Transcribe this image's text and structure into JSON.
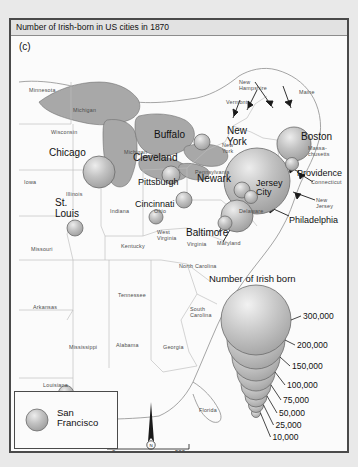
{
  "figure": {
    "title": "Number of Irish-born in US cities in 1870",
    "panel_label": "(c)"
  },
  "legend": {
    "title": "Number of Irish born",
    "values": [
      "300,000",
      "200,000",
      "150,000",
      "100,000",
      "75,000",
      "50,000",
      "25,000",
      "10,000"
    ]
  },
  "inset": {
    "city_line1": "San",
    "city_line2": "Francisco"
  },
  "scale": {
    "min": "0",
    "unit": "Miles",
    "max": "500"
  },
  "compass": {
    "north": "N"
  },
  "colors": {
    "frame": "#4a4a4a",
    "land": "#fbfbfb",
    "lake": "#a8a8a8",
    "bubble": "#b5b5b5",
    "title_bar": "#e2e2e2",
    "page": "#e9e9e9"
  },
  "cities": [
    {
      "name": "Chicago",
      "label_lines": [
        "Chicago"
      ],
      "lx": 38,
      "ly": 128,
      "cx": 88,
      "cy": 152,
      "r": 16
    },
    {
      "name": "Cleveland",
      "label_lines": [
        "Cleveland"
      ],
      "lx": 122,
      "ly": 133,
      "cx": 160,
      "cy": 155,
      "r": 9
    },
    {
      "name": "Buffalo",
      "label_lines": [
        "Buffalo"
      ],
      "lx": 143,
      "ly": 110,
      "cx": 191,
      "cy": 122,
      "r": 8
    },
    {
      "name": "Pittsburgh",
      "label_lines": [
        "Pittsburgh"
      ],
      "lx": 127,
      "ly": 158,
      "cx": 173,
      "cy": 180,
      "r": 8
    },
    {
      "name": "Cincinnati",
      "label_lines": [
        "Cincinnati"
      ],
      "lx": 124,
      "ly": 180,
      "cx": 145,
      "cy": 197,
      "r": 7
    },
    {
      "name": "St. Louis",
      "label_lines": [
        "St.",
        "Louis"
      ],
      "lx": 44,
      "ly": 178,
      "cx": 64,
      "cy": 208,
      "r": 8
    },
    {
      "name": "New York",
      "label_lines": [
        "New",
        "York"
      ],
      "lx": 216,
      "ly": 106,
      "cx": 246,
      "cy": 161,
      "r": 33
    },
    {
      "name": "Newark",
      "label_lines": [
        "Newark"
      ],
      "lx": 186,
      "ly": 154,
      "cx": 231,
      "cy": 170,
      "r": 8
    },
    {
      "name": "Jersey City",
      "label_lines": [
        "Jersey",
        "City"
      ],
      "lx": 245,
      "ly": 159,
      "cx": 240,
      "cy": 177,
      "r": 6.5
    },
    {
      "name": "Boston",
      "label_lines": [
        "Boston"
      ],
      "lx": 290,
      "ly": 112,
      "cx": 283,
      "cy": 124,
      "r": 17
    },
    {
      "name": "Providence",
      "label_lines": [
        "Providence"
      ],
      "lx": 286,
      "ly": 149,
      "cx": 281,
      "cy": 144,
      "r": 6.5
    },
    {
      "name": "Philadelphia",
      "label_lines": [
        "Philadelphia"
      ],
      "lx": 278,
      "ly": 196,
      "cx": 226,
      "cy": 196,
      "r": 16
    },
    {
      "name": "Baltimore",
      "label_lines": [
        "Baltimore"
      ],
      "lx": 175,
      "ly": 208,
      "cx": 214,
      "cy": 203,
      "r": 7
    },
    {
      "name": "New Orleans",
      "label_lines": [
        "New",
        "Orleans"
      ],
      "lx": 72,
      "ly": 378,
      "cx": 55,
      "cy": 373,
      "r": 7.5
    }
  ],
  "states": [
    {
      "name": "Minnesota",
      "lines": [
        "Minnesota"
      ],
      "x": 18,
      "y": 68
    },
    {
      "name": "Michigan-up",
      "lines": [
        "Michigan"
      ],
      "x": 62,
      "y": 88
    },
    {
      "name": "Wisconsin",
      "lines": [
        "Wisconsin"
      ],
      "x": 40,
      "y": 110
    },
    {
      "name": "Michigan",
      "lines": [
        "Michigan"
      ],
      "x": 113,
      "y": 130
    },
    {
      "name": "Iowa",
      "lines": [
        "Iowa"
      ],
      "x": 13,
      "y": 160
    },
    {
      "name": "Illinois",
      "lines": [
        "Illinois"
      ],
      "x": 55,
      "y": 172
    },
    {
      "name": "Indiana",
      "lines": [
        "Indiana"
      ],
      "x": 99,
      "y": 189
    },
    {
      "name": "Ohio",
      "lines": [
        "Ohio"
      ],
      "x": 143,
      "y": 189
    },
    {
      "name": "Missouri",
      "lines": [
        "Missouri"
      ],
      "x": 20,
      "y": 227
    },
    {
      "name": "Kentucky",
      "lines": [
        "Kentucky"
      ],
      "x": 110,
      "y": 224
    },
    {
      "name": "Tennessee",
      "lines": [
        "Tennessee"
      ],
      "x": 107,
      "y": 273
    },
    {
      "name": "Arkansas",
      "lines": [
        "Arkansas"
      ],
      "x": 22,
      "y": 285
    },
    {
      "name": "Mississippi",
      "lines": [
        "Mississippi"
      ],
      "x": 58,
      "y": 325
    },
    {
      "name": "Alabama",
      "lines": [
        "Alabama"
      ],
      "x": 105,
      "y": 323
    },
    {
      "name": "Georgia",
      "lines": [
        "Georgia"
      ],
      "x": 152,
      "y": 325
    },
    {
      "name": "Louisiana",
      "lines": [
        "Louisiana"
      ],
      "x": 32,
      "y": 363
    },
    {
      "name": "Florida",
      "lines": [
        "Florida"
      ],
      "x": 188,
      "y": 388
    },
    {
      "name": "South Carolina",
      "lines": [
        "South",
        "Carolina"
      ],
      "x": 179,
      "y": 287
    },
    {
      "name": "North Carolina",
      "lines": [
        "North Carolina"
      ],
      "x": 168,
      "y": 244
    },
    {
      "name": "Virginia",
      "lines": [
        "Virginia"
      ],
      "x": 176,
      "y": 222
    },
    {
      "name": "West Virginia",
      "lines": [
        "West",
        "Virginia"
      ],
      "x": 146,
      "y": 210
    },
    {
      "name": "Maryland",
      "lines": [
        "Maryland"
      ],
      "x": 206,
      "y": 221
    },
    {
      "name": "Delaware",
      "lines": [
        "Delaware"
      ],
      "x": 228,
      "y": 189
    },
    {
      "name": "Pennsylvania",
      "lines": [
        "Pennsylvania"
      ],
      "x": 184,
      "y": 150
    },
    {
      "name": "New York-st",
      "lines": [
        "New",
        "York"
      ],
      "x": 211,
      "y": 123
    },
    {
      "name": "New Jersey",
      "lines": [
        "New",
        "Jersey"
      ],
      "x": 305,
      "y": 178
    },
    {
      "name": "Connecticut",
      "lines": [
        "Connecticut"
      ],
      "x": 300,
      "y": 160
    },
    {
      "name": "Massachusetts",
      "lines": [
        "Massa-",
        "chusetts"
      ],
      "x": 297,
      "y": 126
    },
    {
      "name": "Vermont",
      "lines": [
        "Vermont"
      ],
      "x": 215,
      "y": 80
    },
    {
      "name": "New Hampshire",
      "lines": [
        "New",
        "Hampshire"
      ],
      "x": 228,
      "y": 60
    },
    {
      "name": "Maine",
      "lines": [
        "Maine"
      ],
      "x": 288,
      "y": 70
    }
  ],
  "legend_circles": [
    {
      "value": "300,000",
      "r": 35,
      "cy": 300,
      "ty": 296
    },
    {
      "value": "200,000",
      "r": 29,
      "cy": 320,
      "ty": 325
    },
    {
      "value": "150,000",
      "r": 24,
      "cy": 337,
      "ty": 346
    },
    {
      "value": "100,000",
      "r": 19,
      "cy": 352,
      "ty": 365
    },
    {
      "value": "75,000",
      "r": 15,
      "cy": 365,
      "ty": 380
    },
    {
      "value": "50,000",
      "r": 11,
      "cy": 376,
      "ty": 393
    },
    {
      "value": "25,000",
      "r": 7.5,
      "cy": 385,
      "ty": 405
    },
    {
      "value": "10,000",
      "r": 4.5,
      "cy": 393,
      "ty": 417
    }
  ]
}
